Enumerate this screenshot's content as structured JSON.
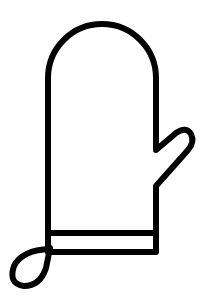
{
  "image": {
    "subject": "oven-mitt-icon",
    "background_color": "#ffffff",
    "stroke_color": "#000000",
    "stroke_width": 6
  }
}
